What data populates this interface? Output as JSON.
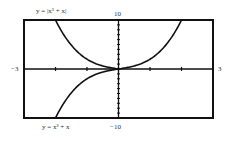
{
  "chart_data": {
    "type": "line",
    "title": "",
    "xlabel": "",
    "ylabel": "",
    "xlim": [
      -3,
      3
    ],
    "ylim": [
      -10,
      10
    ],
    "x_tick_labels": {
      "left": "−3",
      "right": "3"
    },
    "y_tick_labels": {
      "top": "10",
      "bottom": "−10"
    },
    "x_tick_step": 1,
    "y_tick_step": 1,
    "grid": false,
    "series": [
      {
        "name": "y = |x³ + x|",
        "label": "y = |x³ + x|",
        "x": [
          -2.0,
          -1.5,
          -1.0,
          -0.5,
          0,
          0.5,
          1.0,
          1.5,
          2.0
        ],
        "y": [
          10.0,
          4.875,
          2.0,
          0.625,
          0,
          0.625,
          2.0,
          4.875,
          10.0
        ]
      },
      {
        "name": "y = x³ + x",
        "label": "y = x³ + x",
        "x": [
          -2.0,
          -1.5,
          -1.0,
          -0.5,
          0
        ],
        "y": [
          -10.0,
          -4.875,
          -2.0,
          -0.625,
          0
        ]
      }
    ]
  },
  "labels": {
    "top_curve": "y = |x³ + x|",
    "bottom_curve": "y = x³ + x",
    "x_min": "−3",
    "x_max": "3",
    "y_max": "10",
    "y_min": "−10"
  }
}
